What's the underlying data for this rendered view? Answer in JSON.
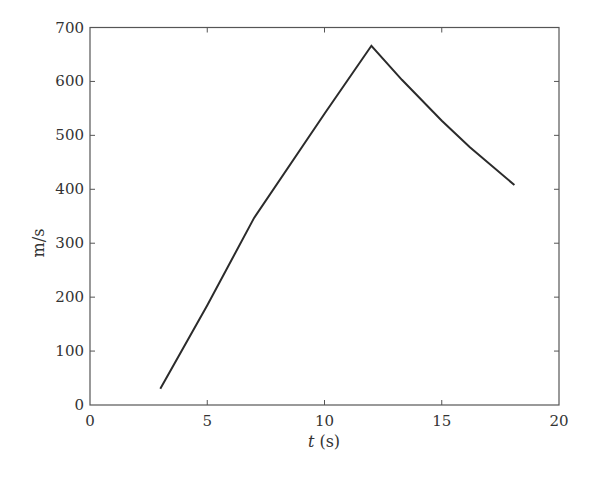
{
  "chart_data": {
    "type": "line",
    "title": "",
    "xlabel_var": "t",
    "xlabel_unit": " (s)",
    "xlabel": "t (s)",
    "ylabel": "m/s",
    "xlim": [
      0,
      20
    ],
    "ylim": [
      0,
      700
    ],
    "xticks": [
      0,
      5,
      10,
      15,
      20
    ],
    "yticks": [
      0,
      100,
      200,
      300,
      400,
      500,
      600,
      700
    ],
    "grid": false,
    "legend": null,
    "series": [
      {
        "name": "velocity",
        "color": "#2b2b2b",
        "x": [
          3,
          5,
          7,
          10,
          12,
          13.3,
          15,
          16.2,
          18.1
        ],
        "y": [
          30,
          185,
          347,
          540,
          666,
          603,
          527,
          478,
          408
        ]
      }
    ]
  }
}
